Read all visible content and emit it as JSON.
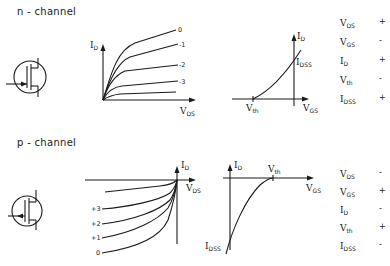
{
  "n_channel": {
    "title": "n - channel",
    "output_chart": {
      "y_label": "I",
      "y_sub": "D",
      "x_label": "V",
      "x_sub": "DS",
      "curve_labels": [
        "0",
        "-1",
        "-2",
        "-3"
      ]
    },
    "transfer_chart": {
      "y_label": "I",
      "y_sub": "D",
      "x_label": "V",
      "x_sub": "GS",
      "idss_label": "I",
      "idss_sub": "DSS",
      "vth_label": "V",
      "vth_sub": "th"
    },
    "sign_table": [
      {
        "symbol": "V",
        "sub": "DS",
        "sign": "+"
      },
      {
        "symbol": "V",
        "sub": "GS",
        "sign": "-"
      },
      {
        "symbol": "I",
        "sub": "D",
        "sign": "+"
      },
      {
        "symbol": "V",
        "sub": "th",
        "sign": "-"
      },
      {
        "symbol": "I",
        "sub": "DSS",
        "sign": "+"
      }
    ]
  },
  "p_channel": {
    "title": "p - channel",
    "output_chart": {
      "y_label": "I",
      "y_sub": "D",
      "x_label": "V",
      "x_sub": "DS",
      "curve_labels": [
        "+3",
        "+2",
        "+1",
        "0"
      ]
    },
    "transfer_chart": {
      "y_label": "I",
      "y_sub": "D",
      "x_label": "V",
      "x_sub": "GS",
      "idss_label": "I",
      "idss_sub": "DSS",
      "vth_label": "V",
      "vth_sub": "th"
    },
    "sign_table": [
      {
        "symbol": "V",
        "sub": "DS",
        "sign": "-"
      },
      {
        "symbol": "V",
        "sub": "GS",
        "sign": "+"
      },
      {
        "symbol": "I",
        "sub": "D",
        "sign": "-"
      },
      {
        "symbol": "V",
        "sub": "th",
        "sign": "+"
      },
      {
        "symbol": "I",
        "sub": "DSS",
        "sign": "-"
      }
    ]
  }
}
